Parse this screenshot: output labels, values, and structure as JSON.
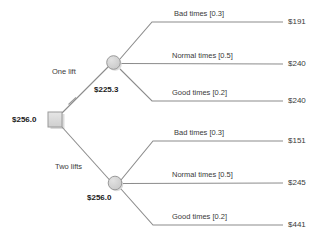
{
  "diagram": {
    "type": "decision-tree",
    "root": {
      "node_type": "decision-square",
      "ev_label": "$256.0"
    },
    "decision_branches": [
      {
        "label": "One lift",
        "pruned": true,
        "ev_label": "$225.3",
        "node_type": "chance-circle",
        "outcomes": [
          {
            "label": "Bad times [0.3]",
            "probability": 0.3,
            "payoff": "$191"
          },
          {
            "label": "Normal times [0.5]",
            "probability": 0.5,
            "payoff": "$240"
          },
          {
            "label": "Good times [0.2]",
            "probability": 0.2,
            "payoff": "$240"
          }
        ]
      },
      {
        "label": "Two lifts",
        "pruned": false,
        "ev_label": "$256.0",
        "node_type": "chance-circle",
        "outcomes": [
          {
            "label": "Bad times [0.3]",
            "probability": 0.3,
            "payoff": "$151"
          },
          {
            "label": "Normal times [0.5]",
            "probability": 0.5,
            "payoff": "$245"
          },
          {
            "label": "Good times [0.2]",
            "probability": 0.2,
            "payoff": "$441"
          }
        ]
      }
    ],
    "colors": {
      "line": "#8c8c8c",
      "node_fill": "#d4d4d4",
      "node_stroke": "#8c8c8c",
      "text": "#3a3a3a",
      "text_bold": "#1a1a1a",
      "background": "#ffffff"
    }
  }
}
